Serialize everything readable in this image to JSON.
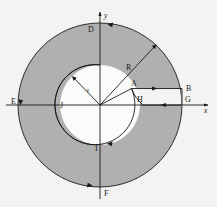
{
  "figure": {
    "background_color": "#f4f3f1",
    "shade_color": "#b0b0b0",
    "line_color": "#1a1a1a",
    "inner_fill_color": "#fbfbfa",
    "center": {
      "x": 100,
      "y": 105
    },
    "outer_radius": 82,
    "inner_radius": 40
  },
  "axes": {
    "x_label": "x",
    "y_label": "y"
  },
  "labels": {
    "A": "A",
    "B": "B",
    "D": "D",
    "E": "E",
    "F": "F",
    "G": "G",
    "H": "H",
    "I": "I",
    "J": "J",
    "R": "R",
    "r": "r"
  },
  "label_positions": {
    "A": {
      "x": 131,
      "y": 86
    },
    "B": {
      "x": 177,
      "y": 87
    },
    "D": {
      "x": 91,
      "y": 30
    },
    "E": {
      "x": 14,
      "y": 105
    },
    "F": {
      "x": 106,
      "y": 196
    },
    "G": {
      "x": 179,
      "y": 101
    },
    "H": {
      "x": 139,
      "y": 101
    },
    "I": {
      "x": 97,
      "y": 150
    },
    "J": {
      "x": 62,
      "y": 108
    },
    "R": {
      "x": 127,
      "y": 67
    },
    "r": {
      "x": 89,
      "y": 90
    },
    "x": {
      "x": 206,
      "y": 108
    },
    "y": {
      "x": 107,
      "y": 17
    }
  },
  "markers": {
    "R_radius_line": {
      "from": "center",
      "angle_deg": 47,
      "label": "R",
      "arrowhead": "outer-end"
    },
    "r_radius_line": {
      "from": "center",
      "angle_deg": 133,
      "label": "r",
      "arrowhead": "inner-end"
    },
    "slot_top_edge": {
      "from": "A",
      "to": "B",
      "arrow_direction": "right"
    },
    "slot_bottom_edge": {
      "from": "G",
      "to": "H",
      "arrow_direction": "left"
    },
    "outer_arc_arrow_top": {
      "at_label": "D",
      "direction": "counterclockwise"
    },
    "outer_arc_arrow_bottom": {
      "at_label": "F",
      "direction": "counterclockwise"
    },
    "outer_arc_arrow_left": {
      "at_label": "E",
      "direction": "counterclockwise"
    },
    "inner_arc_arrow_bottom": {
      "at_label": "I",
      "direction": "counterclockwise"
    }
  }
}
